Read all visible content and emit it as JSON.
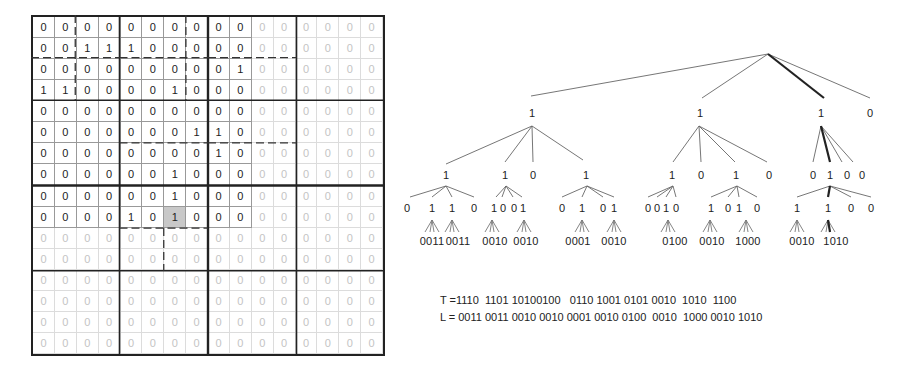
{
  "grid": {
    "rows": 16,
    "cols": 16,
    "active_rows": 10,
    "active_cols": 10,
    "highlight_cell": [
      9,
      6
    ],
    "values": [
      [
        0,
        0,
        0,
        0,
        0,
        0,
        0,
        0,
        0,
        0,
        0,
        0,
        0,
        0,
        0,
        0
      ],
      [
        0,
        0,
        1,
        1,
        1,
        0,
        0,
        0,
        0,
        0,
        0,
        0,
        0,
        0,
        0,
        0
      ],
      [
        0,
        0,
        0,
        0,
        0,
        0,
        0,
        0,
        0,
        1,
        0,
        0,
        0,
        0,
        0,
        0
      ],
      [
        1,
        1,
        0,
        0,
        0,
        0,
        1,
        0,
        0,
        0,
        0,
        0,
        0,
        0,
        0,
        0
      ],
      [
        0,
        0,
        0,
        0,
        0,
        0,
        0,
        0,
        0,
        0,
        0,
        0,
        0,
        0,
        0,
        0
      ],
      [
        0,
        0,
        0,
        0,
        0,
        0,
        0,
        1,
        1,
        0,
        0,
        0,
        0,
        0,
        0,
        0
      ],
      [
        0,
        0,
        0,
        0,
        0,
        0,
        0,
        0,
        1,
        0,
        0,
        0,
        0,
        0,
        0,
        0
      ],
      [
        0,
        0,
        0,
        0,
        0,
        0,
        1,
        0,
        0,
        0,
        0,
        0,
        0,
        0,
        0,
        0
      ],
      [
        0,
        0,
        0,
        0,
        0,
        0,
        1,
        0,
        0,
        0,
        0,
        0,
        0,
        0,
        0,
        0
      ],
      [
        0,
        0,
        0,
        0,
        1,
        0,
        1,
        0,
        0,
        0,
        0,
        0,
        0,
        0,
        0,
        0
      ],
      [
        0,
        0,
        0,
        0,
        0,
        0,
        0,
        0,
        0,
        0,
        0,
        0,
        0,
        0,
        0,
        0
      ],
      [
        0,
        0,
        0,
        0,
        0,
        0,
        0,
        0,
        0,
        0,
        0,
        0,
        0,
        0,
        0,
        0
      ],
      [
        0,
        0,
        0,
        0,
        0,
        0,
        0,
        0,
        0,
        0,
        0,
        0,
        0,
        0,
        0,
        0
      ],
      [
        0,
        0,
        0,
        0,
        0,
        0,
        0,
        0,
        0,
        0,
        0,
        0,
        0,
        0,
        0,
        0
      ],
      [
        0,
        0,
        0,
        0,
        0,
        0,
        0,
        0,
        0,
        0,
        0,
        0,
        0,
        0,
        0,
        0
      ],
      [
        0,
        0,
        0,
        0,
        0,
        0,
        0,
        0,
        0,
        0,
        0,
        0,
        0,
        0,
        0,
        0
      ]
    ]
  },
  "tree": {
    "level1": [
      "1",
      "1",
      "1",
      "0"
    ],
    "level2": [
      "1",
      "1",
      "0",
      "1",
      "1",
      "0",
      "1",
      "0",
      "0",
      "1",
      "0",
      "0"
    ],
    "level3": [
      "0",
      "1",
      "1",
      "0",
      "1",
      "0",
      "0",
      "1",
      "0",
      "1",
      "0",
      "1",
      "0",
      "0",
      "1",
      "0",
      "1",
      "0",
      "1",
      "0",
      "1",
      "1",
      "0",
      "0"
    ],
    "leaves": [
      "0011",
      "0011",
      "0010",
      "0010",
      "0001",
      "0010",
      "0100",
      "0010",
      "1000",
      "0010",
      "1010"
    ]
  },
  "codes": {
    "T": "T =1110  1101 10100100   0110 1001 0101 0010  1010  1100",
    "L": "L = 0011 0011 0010 0010 0001 0010 0100  0010  1000 0010 1010"
  }
}
